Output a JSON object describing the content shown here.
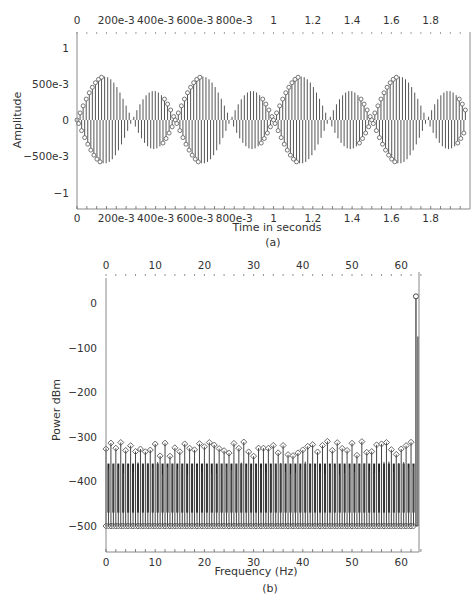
{
  "chart_data": [
    {
      "id": "a",
      "type": "line",
      "subtype": "stem",
      "caption": "(a)",
      "title": "",
      "xlabel": "Time in seconds",
      "ylabel": "Amplitude",
      "xlim": [
        0,
        1.98
      ],
      "ylim": [
        -1.2,
        1.2
      ],
      "x_ticks": [
        "0",
        "200e-3",
        "400e-3",
        "600e-3",
        "800e-3",
        "1",
        "1.2",
        "1.4",
        "1.6",
        "1.8"
      ],
      "y_ticks": [
        "1",
        "500e-3",
        "0",
        "-500e-3",
        "-1"
      ],
      "top_axis_ticks": [
        "0",
        "200e-3",
        "400e-3",
        "600e-3",
        "800e-3",
        "1",
        "1.2",
        "1.4",
        "1.6",
        "1.8"
      ],
      "grid": false,
      "description": "Amplitude-modulated sampled sinusoid with envelope |sin(2*pi*t)|; 4 lobes peaking at t = 0.25, 0.75, 1.25, 1.75 with amplitude 1; stem plot with circle markers",
      "envelope_peaks": [
        {
          "t": 0.25,
          "amplitude": 1
        },
        {
          "t": 0.75,
          "amplitude": 1
        },
        {
          "t": 1.25,
          "amplitude": 1
        },
        {
          "t": 1.75,
          "amplitude": 1
        }
      ],
      "envelope_zeros": [
        0,
        0.5,
        1.0,
        1.5
      ],
      "sample_rate_hz": 128,
      "carrier_hz": 63
    },
    {
      "id": "b",
      "type": "line",
      "subtype": "stem",
      "caption": "(b)",
      "title": "",
      "xlabel": "Frequency (Hz)",
      "ylabel": "Power dBm",
      "xlim": [
        0,
        64
      ],
      "ylim": [
        -560,
        60
      ],
      "x_ticks": [
        "0",
        "10",
        "20",
        "30",
        "40",
        "50",
        "60"
      ],
      "top_axis_ticks": [
        "0",
        "10",
        "20",
        "30",
        "40",
        "50",
        "60"
      ],
      "y_ticks": [
        "0",
        "-100",
        "-200",
        "-300",
        "-400",
        "-500"
      ],
      "grid": false,
      "description": "Power spectrum stem plot: noise floor near -500 dBm with upper markers scattered -310 to -345 dBm; single peak near 63 Hz at about +15 dBm",
      "peak": {
        "frequency_hz": 63,
        "power_dbm": 15
      },
      "noise_floor_dbm": -500,
      "noise_upper_markers_dbm_range": [
        -345,
        -310
      ]
    }
  ]
}
